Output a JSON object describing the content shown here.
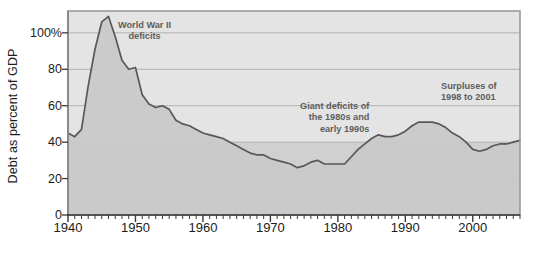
{
  "chart_data": {
    "type": "area",
    "title": "",
    "xlabel": "",
    "ylabel": "Debt as percent of GDP",
    "xlim": [
      1940,
      2007
    ],
    "ylim": [
      0,
      112
    ],
    "grid": true,
    "legend_position": "none",
    "y_ticks": [
      {
        "value": 0,
        "label": "0"
      },
      {
        "value": 20,
        "label": "20"
      },
      {
        "value": 40,
        "label": "40"
      },
      {
        "value": 60,
        "label": "60"
      },
      {
        "value": 80,
        "label": "80"
      },
      {
        "value": 100,
        "label": "100%"
      }
    ],
    "x_ticks": [
      {
        "value": 1940,
        "label": "1940"
      },
      {
        "value": 1950,
        "label": "1950"
      },
      {
        "value": 1960,
        "label": "1960"
      },
      {
        "value": 1970,
        "label": "1970"
      },
      {
        "value": 1980,
        "label": "1980"
      },
      {
        "value": 1990,
        "label": "1990"
      },
      {
        "value": 2000,
        "label": "2000"
      }
    ],
    "x_minor_tick_interval": 1,
    "series": [
      {
        "name": "Debt as percent of GDP",
        "x": [
          1940,
          1941,
          1942,
          1943,
          1944,
          1945,
          1946,
          1947,
          1948,
          1949,
          1950,
          1951,
          1952,
          1953,
          1954,
          1955,
          1956,
          1957,
          1958,
          1959,
          1960,
          1961,
          1962,
          1963,
          1964,
          1965,
          1966,
          1967,
          1968,
          1969,
          1970,
          1971,
          1972,
          1973,
          1974,
          1975,
          1976,
          1977,
          1978,
          1979,
          1980,
          1981,
          1982,
          1983,
          1984,
          1985,
          1986,
          1987,
          1988,
          1989,
          1990,
          1991,
          1992,
          1993,
          1994,
          1995,
          1996,
          1997,
          1998,
          1999,
          2000,
          2001,
          2002,
          2003,
          2004,
          2005,
          2006,
          2007
        ],
        "values": [
          45,
          43,
          47,
          71,
          91,
          106,
          109,
          98,
          85,
          80,
          81,
          66,
          61,
          59,
          60,
          58,
          52,
          50,
          49,
          47,
          45,
          44,
          43,
          42,
          40,
          38,
          36,
          34,
          33,
          33,
          31,
          30,
          29,
          28,
          26,
          27,
          29,
          30,
          28,
          28,
          28,
          28,
          32,
          36,
          39,
          42,
          44,
          43,
          43,
          44,
          46,
          49,
          51,
          51,
          51,
          50,
          48,
          45,
          43,
          40,
          36,
          35,
          36,
          38,
          39,
          39,
          40,
          41
        ]
      }
    ],
    "annotations": [
      {
        "id": "ww2",
        "lines": [
          "World War II",
          "deficits"
        ],
        "anchor_year": 1947,
        "anchor_value": 103
      },
      {
        "id": "giant",
        "lines": [
          "Giant deficits of",
          "the 1980s and",
          "early 1990s"
        ],
        "anchor_year": 1982,
        "anchor_value": 62
      },
      {
        "id": "surplus",
        "lines": [
          "Surpluses of",
          "1998 to 2001"
        ],
        "anchor_year": 2000,
        "anchor_value": 72
      }
    ],
    "colors": {
      "plot_background_upper": "#e4e4e4",
      "plot_background_lower": "#d0d0d0",
      "area_fill": "#c9c9c9",
      "line": "#58585a",
      "gridline": "#b0b0b0",
      "axis": "#8a8a8a",
      "plot_border": "#9a9a9a",
      "tick_label": "#1c1c1c",
      "annotation_text": "#5e5e5e",
      "figure_background": "#ffffff"
    }
  },
  "caption": {
    "text": ""
  }
}
